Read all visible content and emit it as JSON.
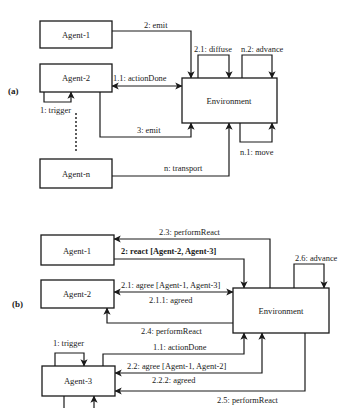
{
  "panel_a": {
    "label": "(a)",
    "agents": [
      "Agent-1",
      "Agent-2",
      "Agent-n"
    ],
    "environment": "Environment",
    "messages": {
      "emit_2": "2: emit",
      "diffuse": "2.1: diffuse",
      "advance": "n.2: advance",
      "action_done": "1.1: actionDone",
      "trigger": "1: trigger",
      "emit_3": "3: emit",
      "move": "n.1: move",
      "transport": "n: transport"
    }
  },
  "panel_b": {
    "label": "(b)",
    "agents": [
      "Agent-1",
      "Agent-2",
      "Agent-3"
    ],
    "environment": "Environment",
    "messages": {
      "perform_react_23": "2.3: performReact",
      "react": "2: react [Agent-2, Agent-3]",
      "advance": "2.6: advance",
      "agree_21": "2.1: agree [Agent-1, Agent-3]",
      "agreed_211": "2.1.1: agreed",
      "perform_react_24": "2.4: performReact",
      "trigger": "1: trigger",
      "action_done": "1.1: actionDone",
      "agree_22": "2.2: agree [Agent-1, Agent-2]",
      "agreed_222": "2.2.2: agreed",
      "perform_react_25": "2.5: performReact"
    }
  }
}
